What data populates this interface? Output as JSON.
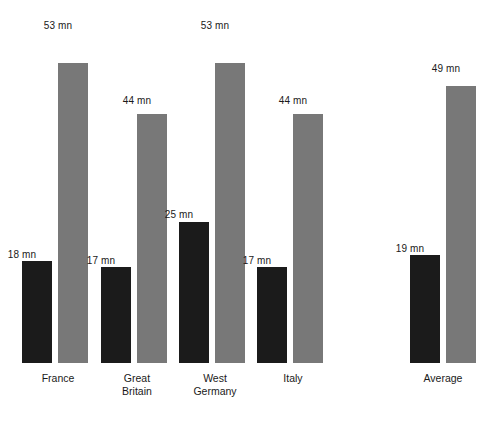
{
  "chart_data": {
    "type": "bar",
    "title": "",
    "subtitle": "",
    "xlabel": "",
    "ylabel": "",
    "unit_label": "mn",
    "grid": false,
    "legend_position": "none",
    "ylim": [
      0,
      58
    ],
    "categories": [
      "France",
      "Great\nBritain",
      "West\nGermany",
      "Italy",
      "Average"
    ],
    "series": [
      {
        "name": "dark",
        "color": "#1b1b1b",
        "values": [
          18,
          17,
          25,
          17,
          19
        ],
        "value_labels": [
          "18 mn",
          "17 mn",
          "25 mn",
          "17 mn",
          "19 mn"
        ]
      },
      {
        "name": "light",
        "color": "#787878",
        "values": [
          53,
          44,
          53,
          44,
          49
        ],
        "value_labels": [
          "53 mn",
          "44 mn",
          "53 mn",
          "44 mn",
          "49 mn"
        ]
      }
    ]
  },
  "groups": [
    {
      "label": "France",
      "label_x": 3,
      "bars": [
        {
          "kind": "dark",
          "x": 22,
          "value": 18,
          "label": "18 mn",
          "label_x": -8,
          "label_y": 249
        },
        {
          "kind": "light",
          "x": 58,
          "value": 53,
          "label": "53 mn",
          "label_x": 28,
          "label_y": 20
        }
      ]
    },
    {
      "label": "Great\nBritain",
      "label_x": 82,
      "bars": [
        {
          "kind": "dark",
          "x": 101,
          "value": 17,
          "label": "17 mn",
          "label_x": 71,
          "label_y": 255
        },
        {
          "kind": "light",
          "x": 137,
          "value": 44,
          "label": "44 mn",
          "label_x": 107,
          "label_y": 95
        }
      ]
    },
    {
      "label": "West\nGermany",
      "label_x": 160,
      "bars": [
        {
          "kind": "dark",
          "x": 179,
          "value": 25,
          "label": "25 mn",
          "label_x": 149,
          "label_y": 209
        },
        {
          "kind": "light",
          "x": 215,
          "value": 53,
          "label": "53 mn",
          "label_x": 185,
          "label_y": 20
        }
      ]
    },
    {
      "label": "Italy",
      "label_x": 238,
      "bars": [
        {
          "kind": "dark",
          "x": 257,
          "value": 17,
          "label": "17 mn",
          "label_x": 227,
          "label_y": 255
        },
        {
          "kind": "light",
          "x": 293,
          "value": 44,
          "label": "44 mn",
          "label_x": 263,
          "label_y": 95
        }
      ]
    },
    {
      "label": "Average",
      "label_x": 388,
      "bars": [
        {
          "kind": "dark",
          "x": 410,
          "value": 19,
          "label": "19 mn",
          "label_x": 380,
          "label_y": 243
        },
        {
          "kind": "light",
          "x": 446,
          "value": 49,
          "label": "49 mn",
          "label_x": 416,
          "label_y": 63
        }
      ]
    }
  ],
  "scale": {
    "px_per_unit": 5.66,
    "baseline_offset_px": 58
  }
}
